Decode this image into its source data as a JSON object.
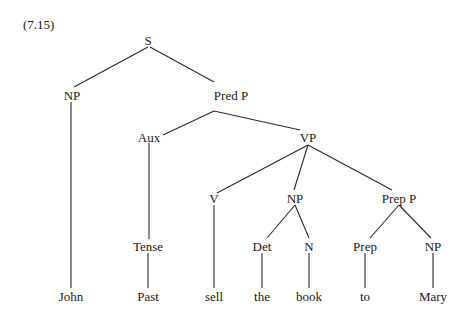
{
  "example_number": "(7.15)",
  "tree": {
    "nodes": [
      {
        "id": "S",
        "label": "S",
        "x": 148,
        "y": 40
      },
      {
        "id": "NP1",
        "label": "NP",
        "x": 72,
        "y": 95
      },
      {
        "id": "PredP",
        "label": "Pred P",
        "x": 231,
        "y": 95
      },
      {
        "id": "Aux",
        "label": "Aux",
        "x": 149,
        "y": 137
      },
      {
        "id": "VP",
        "label": "VP",
        "x": 308,
        "y": 137
      },
      {
        "id": "V",
        "label": "V",
        "x": 214,
        "y": 198
      },
      {
        "id": "NP2",
        "label": "NP",
        "x": 295,
        "y": 198
      },
      {
        "id": "PrepP",
        "label": "Prep P",
        "x": 399,
        "y": 198
      },
      {
        "id": "Tense",
        "label": "Tense",
        "x": 148,
        "y": 246
      },
      {
        "id": "Det",
        "label": "Det",
        "x": 262,
        "y": 246
      },
      {
        "id": "N",
        "label": "N",
        "x": 309,
        "y": 246
      },
      {
        "id": "Prep",
        "label": "Prep",
        "x": 365,
        "y": 246
      },
      {
        "id": "NP3",
        "label": "NP",
        "x": 433,
        "y": 246
      },
      {
        "id": "John",
        "label": "John",
        "x": 71,
        "y": 296
      },
      {
        "id": "Past",
        "label": "Past",
        "x": 148,
        "y": 296
      },
      {
        "id": "sell",
        "label": "sell",
        "x": 214,
        "y": 296
      },
      {
        "id": "the",
        "label": "the",
        "x": 262,
        "y": 296
      },
      {
        "id": "book",
        "label": "book",
        "x": 309,
        "y": 296
      },
      {
        "id": "to",
        "label": "to",
        "x": 365,
        "y": 296
      },
      {
        "id": "Mary",
        "label": "Mary",
        "x": 433,
        "y": 296
      }
    ],
    "edges": [
      {
        "from": "S",
        "to": "NP1",
        "x1": 148,
        "y1": 47,
        "x2": 74,
        "y2": 87
      },
      {
        "from": "S",
        "to": "PredP",
        "x1": 150,
        "y1": 47,
        "x2": 214,
        "y2": 82
      },
      {
        "from": "NP1",
        "to": "John",
        "x1": 71,
        "y1": 102,
        "x2": 71,
        "y2": 288
      },
      {
        "from": "PredP",
        "to": "Aux",
        "x1": 214,
        "y1": 111,
        "x2": 163,
        "y2": 135
      },
      {
        "from": "PredP",
        "to": "VP",
        "x1": 214,
        "y1": 111,
        "x2": 300,
        "y2": 130
      },
      {
        "from": "Aux",
        "to": "Tense",
        "x1": 149,
        "y1": 143,
        "x2": 149,
        "y2": 239
      },
      {
        "from": "VP",
        "to": "V",
        "x1": 308,
        "y1": 145,
        "x2": 217,
        "y2": 193
      },
      {
        "from": "VP",
        "to": "NP2",
        "x1": 308,
        "y1": 145,
        "x2": 294,
        "y2": 190
      },
      {
        "from": "VP",
        "to": "PrepP",
        "x1": 308,
        "y1": 145,
        "x2": 392,
        "y2": 190
      },
      {
        "from": "V",
        "to": "sell",
        "x1": 214,
        "y1": 205,
        "x2": 214,
        "y2": 288
      },
      {
        "from": "NP2",
        "to": "Det",
        "x1": 295,
        "y1": 205,
        "x2": 267,
        "y2": 238
      },
      {
        "from": "NP2",
        "to": "N",
        "x1": 295,
        "y1": 205,
        "x2": 309,
        "y2": 238
      },
      {
        "from": "PrepP",
        "to": "Prep",
        "x1": 399,
        "y1": 205,
        "x2": 370,
        "y2": 238
      },
      {
        "from": "PrepP",
        "to": "NP3",
        "x1": 399,
        "y1": 205,
        "x2": 431,
        "y2": 238
      },
      {
        "from": "Tense",
        "to": "Past",
        "x1": 148,
        "y1": 253,
        "x2": 148,
        "y2": 288
      },
      {
        "from": "Det",
        "to": "the",
        "x1": 262,
        "y1": 253,
        "x2": 262,
        "y2": 288
      },
      {
        "from": "N",
        "to": "book",
        "x1": 309,
        "y1": 253,
        "x2": 309,
        "y2": 288
      },
      {
        "from": "Prep",
        "to": "to",
        "x1": 365,
        "y1": 253,
        "x2": 365,
        "y2": 288
      },
      {
        "from": "NP3",
        "to": "Mary",
        "x1": 433,
        "y1": 253,
        "x2": 433,
        "y2": 288
      }
    ]
  }
}
